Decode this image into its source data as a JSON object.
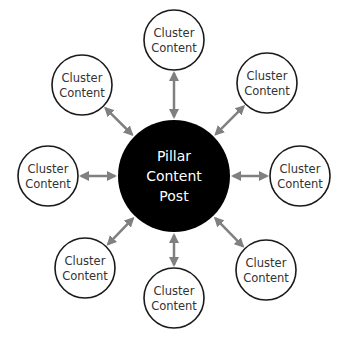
{
  "pillar": {
    "lines": [
      "Pillar",
      "Content",
      "Post"
    ],
    "fill": "#000000",
    "text_color": "#ffffff",
    "cx": 174,
    "cy": 176,
    "r": 56
  },
  "clusters": [
    {
      "id": "top",
      "lines": [
        "Cluster",
        "Content"
      ],
      "cx": 174,
      "cy": 40
    },
    {
      "id": "top-right",
      "lines": [
        "Cluster",
        "Content"
      ],
      "cx": 267,
      "cy": 83
    },
    {
      "id": "right",
      "lines": [
        "Cluster",
        "Content"
      ],
      "cx": 300,
      "cy": 176
    },
    {
      "id": "bottom-right",
      "lines": [
        "Cluster",
        "Content"
      ],
      "cx": 266,
      "cy": 270
    },
    {
      "id": "bottom",
      "lines": [
        "Cluster",
        "Content"
      ],
      "cx": 174,
      "cy": 298
    },
    {
      "id": "bottom-left",
      "lines": [
        "Cluster",
        "Content"
      ],
      "cx": 85,
      "cy": 268
    },
    {
      "id": "left",
      "lines": [
        "Cluster",
        "Content"
      ],
      "cx": 48,
      "cy": 176
    },
    {
      "id": "top-left",
      "lines": [
        "Cluster",
        "Content"
      ],
      "cx": 82,
      "cy": 85
    }
  ],
  "cluster_style": {
    "r": 30,
    "stroke": "#1a1a1a",
    "fill": "#ffffff",
    "text_color": "#333333"
  },
  "arrow_color": "#808080"
}
